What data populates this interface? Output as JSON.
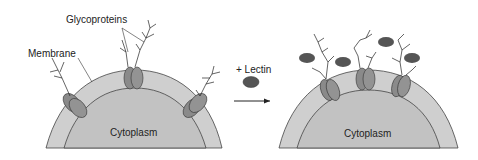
{
  "labels": {
    "glycoproteins": "Glycoproteins",
    "membrane": "Membrane",
    "cytoplasm_left": "Cytoplasm",
    "cytoplasm_right": "Cytoplasm",
    "lectin": "+ Lectin"
  },
  "colors": {
    "membrane_fill": "#c8c8c8",
    "cytoplasm_fill": "#bdbdbd",
    "protein_fill": "#8a8a8a",
    "lectin_fill": "#555555",
    "line": "#333333"
  }
}
